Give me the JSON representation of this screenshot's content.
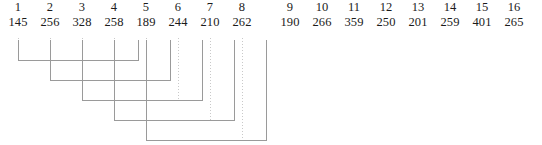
{
  "figure": {
    "type": "bracket-linkage-diagram",
    "width": 542,
    "height": 145,
    "background_color": "#ffffff",
    "guide_line_color": "#c9c9c9",
    "bracket_line_color": "#9a9a9a",
    "text_color": "#1b1b1b"
  },
  "columns": [
    {
      "index": "1",
      "value": "145",
      "x": 18
    },
    {
      "index": "2",
      "value": "256",
      "x": 50
    },
    {
      "index": "3",
      "value": "328",
      "x": 82
    },
    {
      "index": "4",
      "value": "258",
      "x": 114
    },
    {
      "index": "5",
      "value": "189",
      "x": 146
    },
    {
      "index": "6",
      "value": "244",
      "x": 178
    },
    {
      "index": "7",
      "value": "210",
      "x": 210
    },
    {
      "index": "8",
      "value": "262",
      "x": 242
    },
    {
      "index": "9",
      "value": "190",
      "x": 290
    },
    {
      "index": "10",
      "value": "266",
      "x": 322
    },
    {
      "index": "11",
      "value": "359",
      "x": 354
    },
    {
      "index": "12",
      "value": "250",
      "x": 386
    },
    {
      "index": "13",
      "value": "201",
      "x": 418
    },
    {
      "index": "14",
      "value": "259",
      "x": 450
    },
    {
      "index": "15",
      "value": "401",
      "x": 482
    },
    {
      "index": "16",
      "value": "265",
      "x": 514
    }
  ],
  "column_values_ordered": [
    "145",
    "256",
    "328",
    "258",
    "189",
    "244",
    "365",
    "262",
    "190",
    "266",
    "359",
    "250",
    "201",
    "259",
    "401",
    "265"
  ],
  "column_indices_ordered": [
    "1",
    "2",
    "3",
    "4",
    "5",
    "6",
    "7",
    "8",
    "9",
    "10",
    "11",
    "12",
    "13",
    "14",
    "15",
    "16"
  ],
  "guides": [
    {
      "x": 18,
      "y1": 38,
      "y2": 60
    },
    {
      "x": 50,
      "y1": 38,
      "y2": 80
    },
    {
      "x": 82,
      "y1": 38,
      "y2": 100
    },
    {
      "x": 114,
      "y1": 38,
      "y2": 120
    },
    {
      "x": 146,
      "y1": 38,
      "y2": 140
    },
    {
      "x": 178,
      "y1": 38,
      "y2": 100
    },
    {
      "x": 210,
      "y1": 38,
      "y2": 120
    },
    {
      "x": 242,
      "y1": 38,
      "y2": 140
    }
  ],
  "brackets": [
    {
      "name": "bracket-1",
      "from_x": 18,
      "to_x": 138,
      "y": 60,
      "top": 40
    },
    {
      "name": "bracket-2",
      "from_x": 50,
      "to_x": 170,
      "y": 80,
      "top": 40
    },
    {
      "name": "bracket-3",
      "from_x": 82,
      "to_x": 202,
      "y": 100,
      "top": 40
    },
    {
      "name": "bracket-4",
      "from_x": 114,
      "to_x": 234,
      "y": 120,
      "top": 40
    },
    {
      "name": "bracket-5",
      "from_x": 146,
      "to_x": 266,
      "y": 140,
      "top": 40
    }
  ]
}
